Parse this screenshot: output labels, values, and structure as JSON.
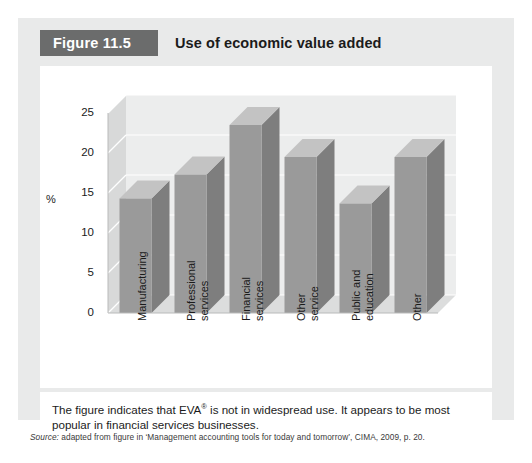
{
  "figure": {
    "label": "Figure 11.5",
    "title": "Use of economic value added"
  },
  "caption": {
    "text_before": "The figure indicates that EVA",
    "superscript": "®",
    "text_after": " is not in widespread use. It appears to be most popular in financial services businesses."
  },
  "source": {
    "prefix": "Source:",
    "text": " adapted from figure in ‘Management accounting tools for today and tomorrow’, CIMA, 2009, p. 20."
  },
  "colors": {
    "card_bg": "#e9eaea",
    "tab_bg": "#6b6c6c",
    "panel_bg": "#ffffff",
    "bar_front": "#9a9a9a",
    "bar_side": "#7e7e7e",
    "bar_top": "#c3c3c3",
    "wall_back": "#eceded",
    "wall_side": "#d8d9d9",
    "floor": "#dcdddd",
    "gridline": "#ffffff",
    "text": "#1b1b1b"
  },
  "chart_data": {
    "type": "bar",
    "title": "Use of economic value added",
    "xlabel": "",
    "ylabel": "%",
    "ylim": [
      0,
      25
    ],
    "yticks": [
      0,
      5,
      10,
      15,
      20,
      25
    ],
    "ytick_labels": [
      "0",
      "5",
      "10",
      "15",
      "20",
      "25"
    ],
    "grid": true,
    "legend": false,
    "three_d": true,
    "categories": [
      "Manufacturing",
      "Professional services",
      "Financial services",
      "Other service",
      "Public and education",
      "Other"
    ],
    "category_lines": [
      [
        "Manufacturing"
      ],
      [
        "Professional",
        "services"
      ],
      [
        "Financial",
        "services"
      ],
      [
        "Other",
        "service"
      ],
      [
        "Public and",
        "education"
      ],
      [
        "Other"
      ]
    ],
    "values": [
      14.3,
      17.3,
      23.5,
      19.5,
      13.7,
      19.5
    ]
  }
}
